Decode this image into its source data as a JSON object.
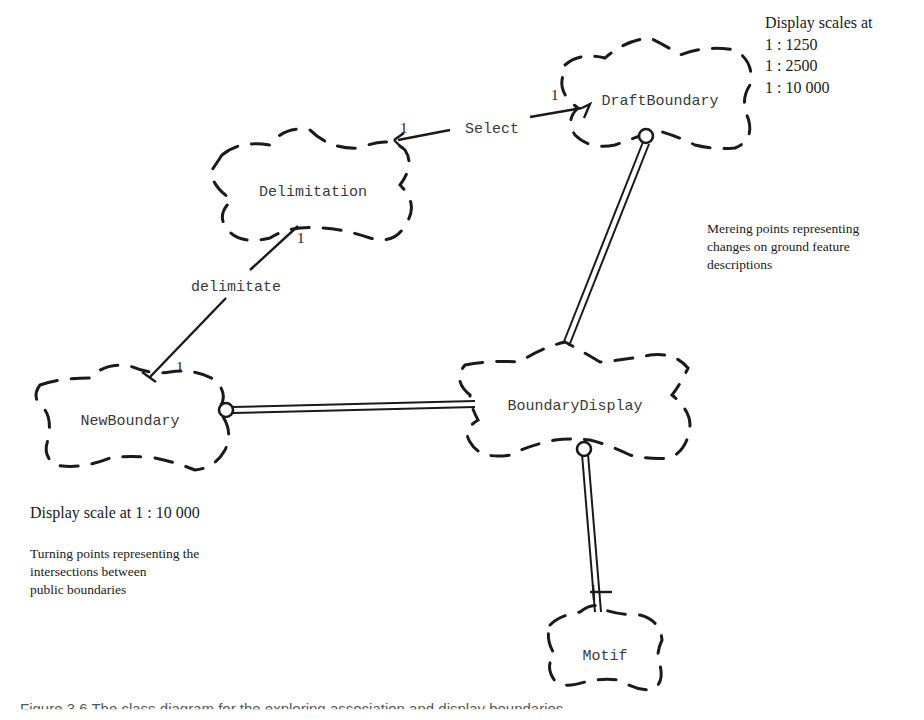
{
  "diagram": {
    "type": "object-association-diagram",
    "notation": "dashed cloud class symbols with association lines",
    "nodes": [
      {
        "id": "delimitation",
        "label": "Delimitation"
      },
      {
        "id": "draft_boundary",
        "label": "DraftBoundary"
      },
      {
        "id": "new_boundary",
        "label": "NewBoundary"
      },
      {
        "id": "boundary_display",
        "label": "BoundaryDisplay"
      },
      {
        "id": "motif",
        "label": "Motif"
      }
    ],
    "edges": [
      {
        "from": "delimitation",
        "to": "draft_boundary",
        "label": "Select",
        "from_multiplicity": "1",
        "to_multiplicity": "1",
        "style": "single-line"
      },
      {
        "from": "delimitation",
        "to": "new_boundary",
        "label": "delimitate",
        "from_multiplicity": "1",
        "to_multiplicity": "1",
        "style": "single-line"
      },
      {
        "from": "draft_boundary",
        "to": "boundary_display",
        "label": "",
        "style": "double-line",
        "end_marker_from": "circle"
      },
      {
        "from": "new_boundary",
        "to": "boundary_display",
        "label": "",
        "style": "double-line",
        "end_marker_from": "circle"
      },
      {
        "from": "boundary_display",
        "to": "motif",
        "label": "",
        "style": "double-line",
        "end_marker_from": "circle",
        "end_marker_to": "crossbar"
      }
    ]
  },
  "labels": {
    "delimitation": "Delimitation",
    "draft_boundary": "DraftBoundary",
    "new_boundary": "NewBoundary",
    "boundary_display": "BoundaryDisplay",
    "motif": "Motif",
    "select": "Select",
    "delimitate": "delimitate",
    "mult_select_delim": "1",
    "mult_select_draft": "1",
    "mult_delim_delimitate": "1",
    "mult_new_delimitate": "1"
  },
  "notes": {
    "draft_scales_title": "Display scales at",
    "draft_scales": [
      "1 : 1250",
      "1 : 2500",
      "1 : 10 000"
    ],
    "mereing": [
      "Mereing points representing",
      "changes on ground feature",
      "descriptions"
    ],
    "new_scale": "Display scale at 1 : 10 000",
    "turning": [
      "Turning points representing the",
      "intersections between",
      "public boundaries"
    ]
  },
  "caption": "Figure 3.6  The class diagram for the exploring association and display boundaries"
}
